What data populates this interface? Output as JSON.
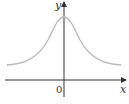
{
  "diagram": {
    "type": "function-graph",
    "axes": {
      "x_label": "x",
      "y_label": "y",
      "origin_label": "0"
    },
    "curve": {
      "shape": "bell-shaped, symmetric about y-axis, horizontal asymptote above x-axis",
      "color": "#b8b8b8"
    },
    "colors": {
      "axis": "#333333",
      "curve": "#b8b8b8",
      "background": "#ffffff"
    }
  }
}
